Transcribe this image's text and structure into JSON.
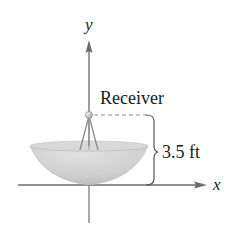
{
  "figure": {
    "axes": {
      "x_label": "x",
      "y_label": "y"
    },
    "labels": {
      "receiver": "Receiver",
      "height": "3.5 ft"
    },
    "colors": {
      "axis": "#6b6b6b",
      "dish_fill": "#c9c9c9",
      "dish_rim": "#dcdcdc",
      "dash": "#8a8a8a",
      "brace": "#555555",
      "text": "#1a1a1a"
    }
  }
}
